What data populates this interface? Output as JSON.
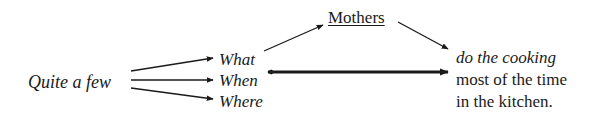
{
  "diagram": {
    "source": {
      "label": "Quite a few"
    },
    "branches": [
      {
        "label": "What"
      },
      {
        "label": "When"
      },
      {
        "label": "Where"
      }
    ],
    "subject": {
      "label": "Mothers",
      "underlined": true
    },
    "predicate": {
      "lines": [
        "do the cooking",
        "most of the time",
        "in the kitchen."
      ]
    },
    "edges": [
      {
        "from": "Quite a few",
        "to": "What",
        "style": "thin-arrow"
      },
      {
        "from": "Quite a few",
        "to": "When",
        "style": "thin-arrow"
      },
      {
        "from": "Quite a few",
        "to": "Where",
        "style": "thin-arrow"
      },
      {
        "from": "What",
        "to": "Mothers",
        "style": "thin-arrow"
      },
      {
        "from": "Mothers",
        "to": "do the cooking",
        "style": "thin-arrow"
      },
      {
        "from": "When",
        "to": "most of the time",
        "style": "thick-double-headed"
      }
    ],
    "colors": {
      "ink": "#1a1a1a",
      "background": "#ffffff"
    }
  }
}
